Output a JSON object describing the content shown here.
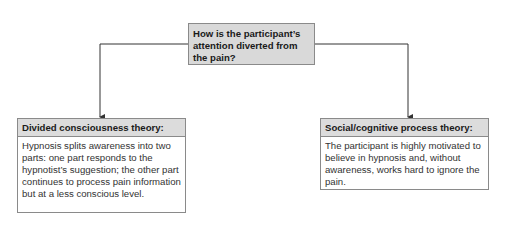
{
  "diagram": {
    "question": {
      "text": "How is the participant’s attention diverted from the pain?"
    },
    "branches": [
      {
        "title": "Divided consciousness theory:",
        "description": "Hypnosis splits awareness into two parts: one part responds to the hypnotist’s suggestion; the other part continues to process pain information but at a less conscious level."
      },
      {
        "title": "Social/cognitive process theory:",
        "description": "The participant is highly motivated to believe in hypnosis and, without awareness, works hard to ignore the pain."
      }
    ],
    "colors": {
      "box_fill": "#d9d9d9",
      "header_fill": "#dcdcdc",
      "border": "#8a8a8a",
      "line": "#333333"
    }
  }
}
